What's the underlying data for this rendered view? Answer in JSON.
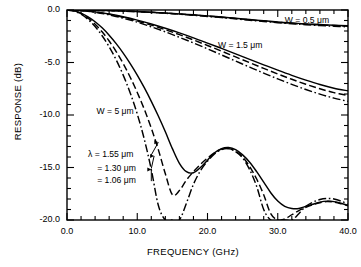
{
  "chart_data": {
    "type": "line",
    "title": "",
    "xlabel": "FREQUENCY (GHz)",
    "ylabel": "RESPONSE (dB)",
    "xlim": [
      0.0,
      40.0
    ],
    "ylim": [
      -20.0,
      0.0
    ],
    "xticks": [
      "0.0",
      "10.0",
      "20.0",
      "30.0",
      "40.0"
    ],
    "yticks": [
      "0.0",
      "-5.0",
      "-10.0",
      "-15.0",
      "-20.0"
    ],
    "xtick_values": [
      0,
      10,
      20,
      30,
      40
    ],
    "ytick_values": [
      0,
      -5,
      -10,
      -15,
      -20
    ],
    "xminor_step": 2,
    "yminor_step": 1,
    "grid": false,
    "legend_position": "inline-annotations",
    "annotations": [
      {
        "text": "W = 0.5 μm",
        "x": 31.0,
        "y": -1.0
      },
      {
        "text": "W = 1.5 μm",
        "x": 21.5,
        "y": -3.4
      },
      {
        "text": "W = 5 μm",
        "x": 4.2,
        "y": -9.7
      },
      {
        "text": "λ = 1.55 μm",
        "x": 3.0,
        "y": -13.8
      },
      {
        "text": "= 1.30 μm",
        "x": 4.3,
        "y": -15.1
      },
      {
        "text": "= 1.06 μm",
        "x": 4.3,
        "y": -16.3
      }
    ],
    "linestyles": {
      "1.55": "solid",
      "1.30": "dashed",
      "1.06": "dashdot"
    },
    "series": [
      {
        "name": "W = 0.5 μm, λ = 1.55 μm",
        "width_um": 0.5,
        "wavelength_um": 1.55,
        "style": "solid",
        "x": [
          0,
          2,
          4,
          6,
          8,
          10,
          12,
          14,
          16,
          18,
          20,
          22,
          24,
          26,
          28,
          30,
          32,
          34,
          36,
          38,
          40
        ],
        "y": [
          0.0,
          -0.01,
          -0.03,
          -0.06,
          -0.1,
          -0.15,
          -0.21,
          -0.29,
          -0.37,
          -0.46,
          -0.56,
          -0.67,
          -0.79,
          -0.91,
          -1.03,
          -1.14,
          -1.24,
          -1.32,
          -1.39,
          -1.45,
          -1.5
        ]
      },
      {
        "name": "W = 0.5 μm, λ = 1.30 μm",
        "width_um": 0.5,
        "wavelength_um": 1.3,
        "style": "dashed",
        "x": [
          0,
          2,
          4,
          6,
          8,
          10,
          12,
          14,
          16,
          18,
          20,
          22,
          24,
          26,
          28,
          30,
          32,
          34,
          36,
          38,
          40
        ],
        "y": [
          0.0,
          -0.01,
          -0.03,
          -0.06,
          -0.1,
          -0.15,
          -0.22,
          -0.3,
          -0.38,
          -0.48,
          -0.58,
          -0.69,
          -0.81,
          -0.93,
          -1.05,
          -1.16,
          -1.26,
          -1.35,
          -1.42,
          -1.48,
          -1.54
        ]
      },
      {
        "name": "W = 0.5 μm, λ = 1.06 μm",
        "width_um": 0.5,
        "wavelength_um": 1.06,
        "style": "dashdot",
        "x": [
          0,
          2,
          4,
          6,
          8,
          10,
          12,
          14,
          16,
          18,
          20,
          22,
          24,
          26,
          28,
          30,
          32,
          34,
          36,
          38,
          40
        ],
        "y": [
          0.0,
          -0.01,
          -0.03,
          -0.06,
          -0.11,
          -0.16,
          -0.23,
          -0.31,
          -0.4,
          -0.5,
          -0.61,
          -0.72,
          -0.84,
          -0.97,
          -1.09,
          -1.21,
          -1.31,
          -1.4,
          -1.48,
          -1.54,
          -1.6
        ]
      },
      {
        "name": "W = 1.5 μm, λ = 1.55 μm",
        "width_um": 1.5,
        "wavelength_um": 1.55,
        "style": "solid",
        "x": [
          0,
          2,
          4,
          6,
          8,
          10,
          12,
          14,
          16,
          18,
          20,
          22,
          24,
          26,
          28,
          30,
          32,
          34,
          36,
          38,
          40
        ],
        "y": [
          0.0,
          -0.05,
          -0.18,
          -0.38,
          -0.64,
          -0.96,
          -1.33,
          -1.74,
          -2.18,
          -2.65,
          -3.15,
          -3.66,
          -4.18,
          -4.7,
          -5.22,
          -5.73,
          -6.22,
          -6.68,
          -7.1,
          -7.45,
          -7.7
        ]
      },
      {
        "name": "W = 1.5 μm, λ = 1.30 μm",
        "width_um": 1.5,
        "wavelength_um": 1.3,
        "style": "dashed",
        "x": [
          0,
          2,
          4,
          6,
          8,
          10,
          12,
          14,
          16,
          18,
          20,
          22,
          24,
          26,
          28,
          30,
          32,
          34,
          36,
          38,
          40
        ],
        "y": [
          0.0,
          -0.05,
          -0.19,
          -0.41,
          -0.7,
          -1.04,
          -1.44,
          -1.88,
          -2.35,
          -2.85,
          -3.38,
          -3.92,
          -4.47,
          -5.02,
          -5.56,
          -6.09,
          -6.6,
          -7.07,
          -7.5,
          -7.87,
          -8.15
        ]
      },
      {
        "name": "W = 1.5 μm, λ = 1.06 μm",
        "width_um": 1.5,
        "wavelength_um": 1.06,
        "style": "dashdot",
        "x": [
          0,
          2,
          4,
          6,
          8,
          10,
          12,
          14,
          16,
          18,
          20,
          22,
          24,
          26,
          28,
          30,
          32,
          34,
          36,
          38,
          40
        ],
        "y": [
          0.0,
          -0.06,
          -0.21,
          -0.46,
          -0.78,
          -1.16,
          -1.6,
          -2.08,
          -2.6,
          -3.14,
          -3.7,
          -4.28,
          -4.86,
          -5.44,
          -6.01,
          -6.56,
          -7.08,
          -7.57,
          -8.01,
          -8.39,
          -8.7
        ]
      },
      {
        "name": "W = 5 μm, λ = 1.55 μm",
        "width_um": 5,
        "wavelength_um": 1.55,
        "style": "solid",
        "x": [
          0,
          1,
          2,
          3,
          4,
          5,
          6,
          7,
          8,
          9,
          10,
          11,
          12,
          13,
          14,
          15,
          16,
          17,
          18,
          19,
          20,
          21,
          22,
          23,
          24,
          25,
          26,
          27,
          28,
          29,
          30,
          31,
          32,
          33,
          34,
          35,
          36,
          37,
          38,
          39,
          40
        ],
        "y": [
          0.0,
          -0.08,
          -0.3,
          -0.65,
          -1.12,
          -1.7,
          -2.4,
          -3.2,
          -4.1,
          -5.1,
          -6.2,
          -7.4,
          -8.7,
          -10.1,
          -11.6,
          -13.2,
          -14.6,
          -15.4,
          -15.5,
          -15.0,
          -14.3,
          -13.6,
          -13.2,
          -13.1,
          -13.3,
          -13.8,
          -14.5,
          -15.4,
          -16.4,
          -17.4,
          -18.2,
          -18.7,
          -18.9,
          -18.9,
          -18.7,
          -18.5,
          -18.3,
          -18.2,
          -18.25,
          -18.4,
          -18.6
        ]
      },
      {
        "name": "W = 5 μm, λ = 1.30 μm",
        "width_um": 5,
        "wavelength_um": 1.3,
        "style": "dashed",
        "x": [
          0,
          1,
          2,
          3,
          4,
          5,
          6,
          7,
          8,
          9,
          10,
          11,
          12,
          13,
          14,
          15,
          16,
          17,
          18,
          19,
          20,
          21,
          22,
          23,
          24,
          25,
          26,
          27,
          28,
          29,
          30,
          31,
          32,
          33,
          34,
          35,
          36,
          37,
          38,
          39,
          40
        ],
        "y": [
          0.0,
          -0.09,
          -0.35,
          -0.78,
          -1.36,
          -2.08,
          -2.95,
          -3.96,
          -5.1,
          -6.4,
          -7.85,
          -9.45,
          -11.25,
          -13.3,
          -15.6,
          -17.6,
          -17.2,
          -16.2,
          -15.4,
          -14.7,
          -14.1,
          -13.6,
          -13.25,
          -13.2,
          -13.45,
          -14.0,
          -14.9,
          -16.1,
          -17.6,
          -19.4,
          -20.0,
          -19.9,
          -19.5,
          -19.1,
          -18.8,
          -18.55,
          -18.35,
          -18.25,
          -18.3,
          -18.45,
          -18.65
        ]
      },
      {
        "name": "W = 5 μm, λ = 1.06 μm",
        "width_um": 5,
        "wavelength_um": 1.06,
        "style": "dashdot",
        "x": [
          0,
          1,
          2,
          3,
          4,
          5,
          6,
          7,
          8,
          9,
          10,
          11,
          12,
          13,
          14,
          15,
          16,
          17,
          18,
          19,
          20,
          21,
          22,
          23,
          24,
          25,
          26,
          27,
          28,
          29,
          30,
          31,
          32,
          33,
          34,
          35,
          36,
          37,
          38,
          39,
          40
        ],
        "y": [
          0.0,
          -0.1,
          -0.4,
          -0.9,
          -1.58,
          -2.45,
          -3.5,
          -4.75,
          -6.2,
          -7.9,
          -9.9,
          -12.3,
          -15.2,
          -18.6,
          -20.0,
          -20.0,
          -20.0,
          -18.4,
          -16.6,
          -15.3,
          -14.4,
          -13.7,
          -13.3,
          -13.2,
          -13.5,
          -14.1,
          -15.2,
          -16.8,
          -19.0,
          -20.0,
          -20.0,
          -20.0,
          -20.0,
          -19.4,
          -18.7,
          -18.3,
          -18.05,
          -17.95,
          -18.0,
          -18.2,
          -18.5
        ]
      }
    ]
  },
  "axis": {
    "xlabel": "FREQUENCY (GHz)",
    "ylabel": "RESPONSE (dB)"
  }
}
